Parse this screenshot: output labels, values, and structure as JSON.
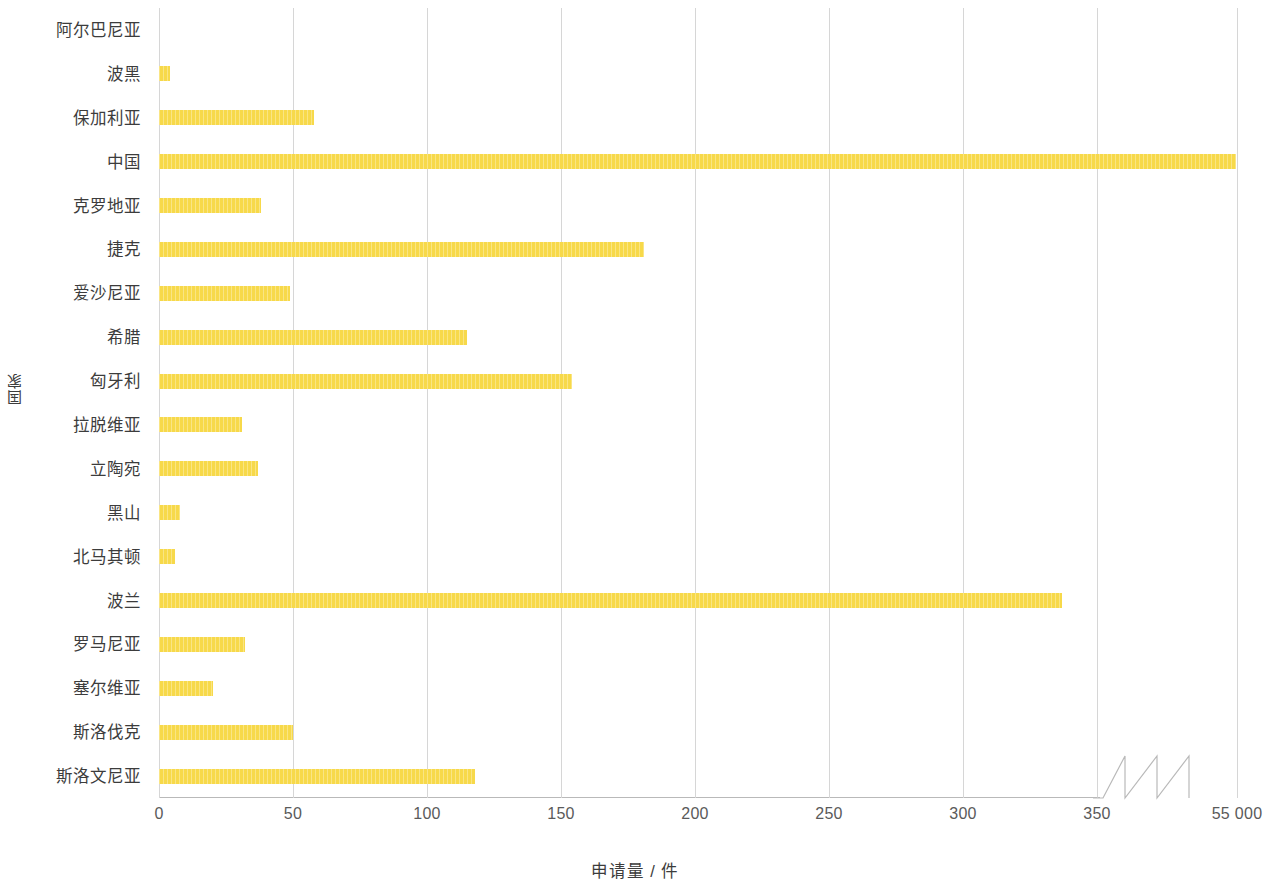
{
  "chart_data": {
    "type": "bar",
    "orientation": "horizontal",
    "title": "",
    "xlabel": "申请量 / 件",
    "ylabel": "国家",
    "categories": [
      "阿尔巴尼亚",
      "波黑",
      "保加利亚",
      "中国",
      "克罗地亚",
      "捷克",
      "爱沙尼亚",
      "希腊",
      "匈牙利",
      "拉脱维亚",
      "立陶宛",
      "黑山",
      "北马其顿",
      "波兰",
      "罗马尼亚",
      "塞尔维亚",
      "斯洛伐克",
      "斯洛文尼亚"
    ],
    "values": [
      0,
      4,
      58,
      54800,
      38,
      181,
      49,
      115,
      154,
      31,
      37,
      8,
      6,
      337,
      32,
      20,
      50,
      118
    ],
    "xtick_labels": [
      "0",
      "50",
      "100",
      "150",
      "200",
      "250",
      "300",
      "350",
      "55 000"
    ],
    "xtick_values": [
      0,
      50,
      100,
      150,
      200,
      250,
      300,
      350,
      55000
    ],
    "xlim": [
      0,
      55000
    ],
    "axis_break": true,
    "axis_break_after": 350,
    "grid": "vertical",
    "legend": "none",
    "bar_color": "#f7d94a",
    "gridline_color": "#d6d6d6",
    "axis_color": "#b9b9b9",
    "text_color": "#3c3c3c"
  }
}
